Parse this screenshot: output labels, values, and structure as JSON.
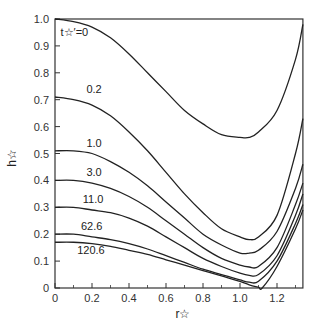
{
  "chart_data": {
    "type": "line",
    "title": "",
    "xlabel": "r☆",
    "ylabel": "h☆",
    "xlim": [
      0,
      1.34
    ],
    "ylim": [
      0,
      1.0
    ],
    "grid": false,
    "legend_position": "inline curve labels",
    "x_ticks": [
      0,
      0.2,
      0.4,
      0.6,
      0.8,
      1.0,
      1.2
    ],
    "x_tick_labels": [
      "0",
      "0.2",
      "0.4",
      "0.6",
      "0.8",
      "1.0",
      "1.2"
    ],
    "y_ticks": [
      0,
      0.1,
      0.2,
      0.3,
      0.4,
      0.5,
      0.6,
      0.7,
      0.8,
      0.9,
      1.0
    ],
    "y_tick_labels": [
      "0",
      "0.1",
      "0.2",
      "0.3",
      "0.4",
      "0.5",
      "0.6",
      "0.7",
      "0.8",
      "0.9",
      "1.0"
    ],
    "parameter_label": "t☆′",
    "series": [
      {
        "name": "t☆′=0",
        "label": "t☆′=0",
        "x": [
          0,
          0.1,
          0.2,
          0.3,
          0.4,
          0.5,
          0.6,
          0.7,
          0.8,
          0.9,
          1.0,
          1.05,
          1.1,
          1.2,
          1.3,
          1.34
        ],
        "y": [
          1.0,
          0.99,
          0.97,
          0.93,
          0.87,
          0.8,
          0.73,
          0.66,
          0.61,
          0.57,
          0.56,
          0.56,
          0.58,
          0.66,
          0.85,
          0.98
        ]
      },
      {
        "name": "0.2",
        "label": "0.2",
        "x": [
          0,
          0.1,
          0.2,
          0.3,
          0.4,
          0.5,
          0.6,
          0.7,
          0.8,
          0.9,
          1.0,
          1.05,
          1.1,
          1.2,
          1.3,
          1.34
        ],
        "y": [
          0.71,
          0.7,
          0.68,
          0.64,
          0.58,
          0.51,
          0.43,
          0.35,
          0.28,
          0.22,
          0.19,
          0.18,
          0.19,
          0.27,
          0.5,
          0.63
        ]
      },
      {
        "name": "1.0",
        "label": "1.0",
        "x": [
          0,
          0.1,
          0.2,
          0.3,
          0.4,
          0.5,
          0.6,
          0.7,
          0.8,
          0.9,
          1.0,
          1.05,
          1.1,
          1.2,
          1.3,
          1.34
        ],
        "y": [
          0.51,
          0.51,
          0.5,
          0.47,
          0.43,
          0.38,
          0.32,
          0.26,
          0.2,
          0.16,
          0.13,
          0.13,
          0.14,
          0.21,
          0.37,
          0.46
        ]
      },
      {
        "name": "3.0",
        "label": "3.0",
        "x": [
          0,
          0.1,
          0.2,
          0.3,
          0.4,
          0.5,
          0.6,
          0.7,
          0.8,
          0.9,
          1.0,
          1.05,
          1.1,
          1.2,
          1.3,
          1.34
        ],
        "y": [
          0.4,
          0.4,
          0.39,
          0.37,
          0.34,
          0.3,
          0.25,
          0.2,
          0.15,
          0.11,
          0.085,
          0.078,
          0.08,
          0.15,
          0.31,
          0.39
        ]
      },
      {
        "name": "11.0",
        "label": "11.0",
        "x": [
          0,
          0.1,
          0.2,
          0.3,
          0.4,
          0.5,
          0.6,
          0.7,
          0.8,
          0.9,
          1.0,
          1.05,
          1.1,
          1.2,
          1.3,
          1.34
        ],
        "y": [
          0.3,
          0.3,
          0.29,
          0.28,
          0.26,
          0.23,
          0.19,
          0.15,
          0.11,
          0.08,
          0.055,
          0.047,
          0.05,
          0.12,
          0.27,
          0.35
        ]
      },
      {
        "name": "62.6",
        "label": "62.6",
        "x": [
          0,
          0.1,
          0.2,
          0.3,
          0.4,
          0.5,
          0.6,
          0.7,
          0.8,
          0.9,
          1.0,
          1.05,
          1.1,
          1.2,
          1.3,
          1.34
        ],
        "y": [
          0.2,
          0.2,
          0.19,
          0.18,
          0.165,
          0.145,
          0.12,
          0.095,
          0.07,
          0.05,
          0.03,
          0.022,
          0.025,
          0.1,
          0.24,
          0.31
        ]
      },
      {
        "name": "120.6",
        "label": "120.6",
        "x": [
          0,
          0.1,
          0.2,
          0.3,
          0.4,
          0.5,
          0.6,
          0.7,
          0.8,
          0.9,
          1.0,
          1.05,
          1.1,
          1.12,
          1.2,
          1.3,
          1.34
        ],
        "y": [
          0.17,
          0.17,
          0.165,
          0.155,
          0.14,
          0.125,
          0.105,
          0.085,
          0.065,
          0.045,
          0.025,
          0.012,
          0.003,
          0.0,
          0.08,
          0.22,
          0.29
        ]
      }
    ]
  }
}
